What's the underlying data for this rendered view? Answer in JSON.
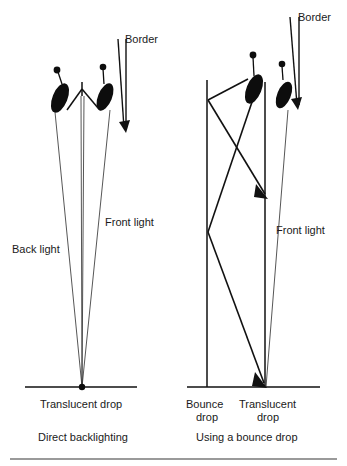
{
  "figure": {
    "background_color": "#ffffff",
    "line_color": "#111111",
    "text_color": "#1a1a1a",
    "rule_color": "#9a9a9a",
    "width": 347,
    "height": 466
  },
  "panels": [
    {
      "id": "left",
      "caption": "Direct backlighting",
      "labels": {
        "border": "Border",
        "back_light": "Back light",
        "front_light": "Front light",
        "drop": "Translucent drop"
      },
      "elements": {
        "fixture_left_name": "back-light-fixture",
        "fixture_right_name": "front-light-fixture",
        "drop_surface_name": "translucent-drop-surface",
        "border_flag_name": "border-flag"
      }
    },
    {
      "id": "right",
      "caption": "Using a bounce drop",
      "labels": {
        "border": "Border",
        "front_light": "Front light",
        "bounce_drop": "Bounce\ndrop",
        "bounce_drop_line1": "Bounce",
        "bounce_drop_line2": "drop",
        "drop": "Translucent\ndrop",
        "drop_line1": "Translucent",
        "drop_line2": "drop"
      },
      "elements": {
        "fixture_left_name": "bounce-light-fixture",
        "fixture_right_name": "front-light-fixture",
        "bounce_drop_name": "bounce-drop-surface",
        "drop_surface_name": "translucent-drop-surface",
        "border_flag_name": "border-flag"
      }
    }
  ]
}
